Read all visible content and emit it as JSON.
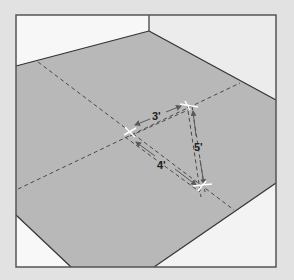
{
  "diagram": {
    "colors": {
      "page_background": "#e2e2e2",
      "floor": "#b7b7b7",
      "wall_left": "#f6f6f6",
      "wall_right": "#ebebeb",
      "frame_border": "#555555",
      "dashed_line": "#4a4a4a",
      "arrow": "#5a5a5a",
      "marker": "#ffffff",
      "label": "#222222"
    },
    "labels": {
      "side_a": "3'",
      "side_b": "4'",
      "side_c": "5'"
    },
    "measurements": [
      {
        "side": "a",
        "length_ft": 3
      },
      {
        "side": "b",
        "length_ft": 4
      },
      {
        "side": "c",
        "length_ft": 5
      }
    ]
  }
}
